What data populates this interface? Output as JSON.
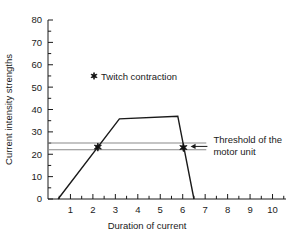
{
  "chart_data": {
    "type": "line",
    "title": "",
    "xlabel": "Duration of current",
    "ylabel": "Current intensity strengths",
    "xlim": [
      0,
      10.6
    ],
    "ylim": [
      0,
      80
    ],
    "grid": false,
    "x_ticks": [
      1,
      2,
      3,
      4,
      5,
      6,
      7,
      8,
      9,
      10
    ],
    "x_tick_labels": [
      "1",
      "2",
      "3",
      "4",
      "5",
      "6",
      "7",
      "8",
      "9",
      "10"
    ],
    "x_minor_tick_step": 0.5,
    "y_ticks": [
      0,
      10,
      20,
      30,
      40,
      50,
      60,
      70,
      80
    ],
    "y_tick_labels": [
      "0",
      "10",
      "20",
      "30",
      "40",
      "50",
      "60",
      "70",
      "80"
    ],
    "y_minor_tick_step": 5,
    "series": [
      {
        "name": "Current intensity curve",
        "type": "line",
        "color": "#1a1a1a",
        "points": [
          {
            "x": 0.45,
            "y": 0
          },
          {
            "x": 3.18,
            "y": 35.8
          },
          {
            "x": 5.78,
            "y": 37.0
          },
          {
            "x": 6.5,
            "y": 0
          }
        ]
      }
    ],
    "markers": [
      {
        "label": "Twitch contraction",
        "x": 2.22,
        "y": 23.2,
        "symbol": "star"
      },
      {
        "label": "Twitch contraction",
        "x": 6.03,
        "y": 23.0,
        "symbol": "star"
      }
    ],
    "threshold_lines": [
      {
        "y": 25.0,
        "x_start": 0.0,
        "x_end": 7.05,
        "color": "#8a8a8a"
      },
      {
        "y": 22.0,
        "x_start": 0.0,
        "x_end": 7.05,
        "color": "#8a8a8a"
      }
    ],
    "annotations": [
      {
        "name": "threshold-annotation",
        "text_line_1": "Threshold of the",
        "text_line_2": "motor unit",
        "arrow": "left-arrow",
        "arrow_from_x": 7.1,
        "arrow_to_x": 6.35,
        "arrow_y": 23.5
      }
    ],
    "legend": {
      "position": "inside-upper-left",
      "entries": [
        {
          "symbol": "star",
          "label": "Twitch contraction",
          "x": 2.05,
          "y": 55.0
        }
      ]
    },
    "colors": {
      "axis": "#1a1a1a",
      "data": "#1a1a1a",
      "threshold": "#8a8a8a",
      "background": "#ffffff"
    }
  }
}
